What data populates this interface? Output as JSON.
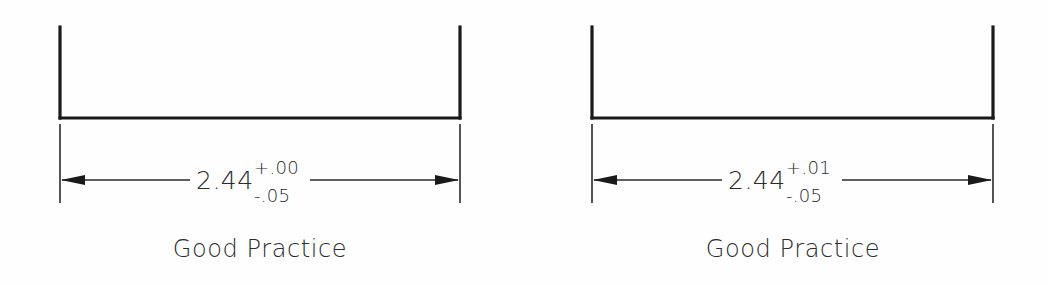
{
  "figure": {
    "background_color": "#fefefe",
    "line_color": "#1a1a1a",
    "text_color": "#2b2b2b"
  },
  "panels": [
    {
      "id": "left-panel",
      "caption": "Good Practice",
      "dimension": {
        "nominal": "2.44",
        "upper_tolerance": "+.00",
        "lower_tolerance": "-.05"
      },
      "geometry": {
        "left_x": 60,
        "right_x": 460,
        "top_y": 27,
        "bottom_y": 118,
        "ext_top_y": 124,
        "ext_bottom_y": 203,
        "dim_y": 180,
        "text_gap_start": 190,
        "text_gap_end": 310
      }
    },
    {
      "id": "right-panel",
      "caption": "Good Practice",
      "dimension": {
        "nominal": "2.44",
        "upper_tolerance": "+.01",
        "lower_tolerance": "-.05"
      },
      "geometry": {
        "left_x": 592,
        "right_x": 993,
        "top_y": 27,
        "bottom_y": 118,
        "ext_top_y": 124,
        "ext_bottom_y": 203,
        "dim_y": 180,
        "text_gap_start": 722,
        "text_gap_end": 842
      }
    }
  ]
}
